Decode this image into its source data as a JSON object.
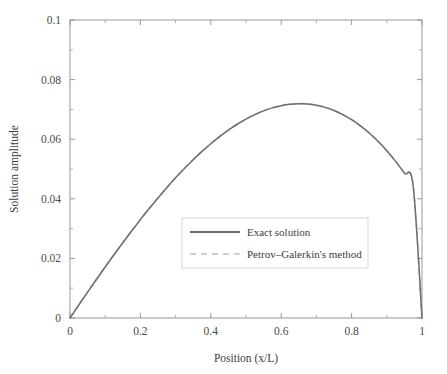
{
  "chart_data": {
    "type": "line",
    "title": "",
    "xlabel": "Position (x/L)",
    "ylabel": "Solution amplitude",
    "xlim": [
      0,
      1
    ],
    "ylim": [
      0,
      0.1
    ],
    "grid": false,
    "legend_position": "center",
    "xticks": [
      "0",
      "0.2",
      "0.4",
      "0.6",
      "0.8",
      "1"
    ],
    "xtick_values": [
      0,
      0.2,
      0.4,
      0.6,
      0.8,
      1
    ],
    "yticks": [
      "0",
      "0.02",
      "0.04",
      "0.06",
      "0.08",
      "0.1"
    ],
    "ytick_values": [
      0,
      0.02,
      0.04,
      0.06,
      0.08,
      0.1
    ],
    "xminor_values": [
      0.1,
      0.3,
      0.5,
      0.7,
      0.9
    ],
    "yminor_values": [
      0.01,
      0.03,
      0.05,
      0.07,
      0.09
    ],
    "x": [
      0,
      0.025,
      0.05,
      0.075,
      0.1,
      0.125,
      0.15,
      0.175,
      0.2,
      0.225,
      0.25,
      0.275,
      0.3,
      0.325,
      0.35,
      0.375,
      0.4,
      0.425,
      0.45,
      0.475,
      0.5,
      0.525,
      0.55,
      0.575,
      0.6,
      0.625,
      0.65,
      0.675,
      0.7,
      0.725,
      0.75,
      0.775,
      0.8,
      0.825,
      0.85,
      0.875,
      0.9,
      0.925,
      0.95,
      0.975,
      1
    ],
    "series": [
      {
        "name": "Exact solution",
        "style": "solid",
        "color": "#6e6e6e",
        "values": [
          0,
          0.00435,
          0.00866,
          0.01292,
          0.01711,
          0.02123,
          0.02526,
          0.02919,
          0.03302,
          0.03672,
          0.0403,
          0.04374,
          0.04703,
          0.05016,
          0.05312,
          0.0559,
          0.05849,
          0.06088,
          0.06306,
          0.06502,
          0.06676,
          0.06826,
          0.06952,
          0.07052,
          0.07126,
          0.07173,
          0.07192,
          0.07181,
          0.0714,
          0.07068,
          0.06964,
          0.06827,
          0.06656,
          0.0645,
          0.06208,
          0.05929,
          0.05612,
          0.05256,
          0.0486,
          0.04422,
          0.0
        ]
      },
      {
        "name": "Petrov–Galerkin's method",
        "style": "dashed",
        "color": "#bdbdbd",
        "values": [
          0,
          0.0044,
          0.00873,
          0.01298,
          0.01717,
          0.02128,
          0.02531,
          0.02924,
          0.03306,
          0.03676,
          0.04034,
          0.04378,
          0.04707,
          0.0502,
          0.05316,
          0.05594,
          0.05853,
          0.06092,
          0.0631,
          0.06506,
          0.0668,
          0.0683,
          0.06956,
          0.07056,
          0.0713,
          0.07177,
          0.07196,
          0.07185,
          0.07144,
          0.07072,
          0.06968,
          0.06831,
          0.0666,
          0.06454,
          0.06212,
          0.05933,
          0.05616,
          0.0526,
          0.04864,
          0.04426,
          0.0
        ]
      }
    ],
    "peak": {
      "x": 0.565,
      "y": 0.0719
    }
  },
  "legend": {
    "entries": [
      {
        "label": "Exact solution",
        "style": "solid"
      },
      {
        "label": "Petrov–Galerkin's method",
        "style": "dashed"
      }
    ]
  },
  "colors": {
    "axis": "#8c8c8c",
    "exact": "#6e6e6e",
    "petrov_galerkin": "#bdbdbd",
    "text": "#3d3d3d",
    "legend_border": "#cccccc",
    "background": "#ffffff"
  }
}
